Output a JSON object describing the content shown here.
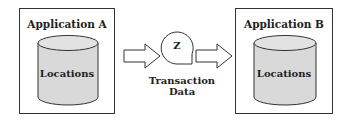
{
  "diagram": {
    "left_app": {
      "title": "Application A",
      "store_label": "Locations"
    },
    "right_app": {
      "title": "Application B",
      "store_label": "Locations"
    },
    "transfer": {
      "node_label": "Z",
      "caption": "Transaction Data"
    },
    "colors": {
      "cylinder_fill": "#d9d9d9",
      "stroke": "#333333",
      "background": "#ffffff"
    }
  }
}
